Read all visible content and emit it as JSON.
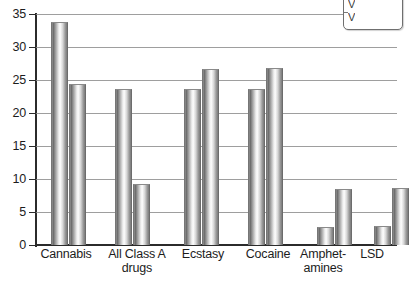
{
  "chart_data": {
    "type": "bar",
    "title": "",
    "subtitle": "",
    "xlabel": "",
    "ylabel": "",
    "ylim": [
      0,
      35
    ],
    "yticks": [
      0,
      5,
      10,
      15,
      20,
      25,
      30,
      35
    ],
    "ytick_labels": [
      "0",
      "5",
      "10",
      "15",
      "20",
      "25",
      "30",
      "35"
    ],
    "grid": true,
    "legend_position": "top-right",
    "categories": [
      "Cannabis",
      "All Class A\ndrugs",
      "Ecstasy",
      "Cocaine",
      "Amphet-\namines",
      "LSD"
    ],
    "series": [
      {
        "name": "series-1",
        "values": [
          34.0,
          23.7,
          23.7,
          23.7,
          2.8,
          2.9
        ]
      },
      {
        "name": "series-2",
        "values": [
          24.5,
          9.3,
          26.8,
          27.0,
          8.6,
          8.7
        ]
      }
    ],
    "bar_style": "cylinder-gradient-grey",
    "annotations": []
  },
  "axis": {
    "y_labels": [
      "35",
      "30",
      "25",
      "20",
      "15",
      "10",
      "5",
      "0"
    ]
  },
  "categories_display": [
    "Cannabis",
    "All Class A\ndrugs",
    "Ecstasy",
    "Cocaine",
    "Amphet-\namines",
    "LSD"
  ],
  "legend": {
    "visible_text": "V\nV",
    "note": "legend box clipped at right edge of image"
  },
  "colors": {
    "axis": "#2b2b2b",
    "gridline": "#8d8d8d",
    "bar_light": "#fcfcfc",
    "bar_dark": "#6e6e6e",
    "text": "#1c1c1c",
    "background": "#ffffff"
  }
}
